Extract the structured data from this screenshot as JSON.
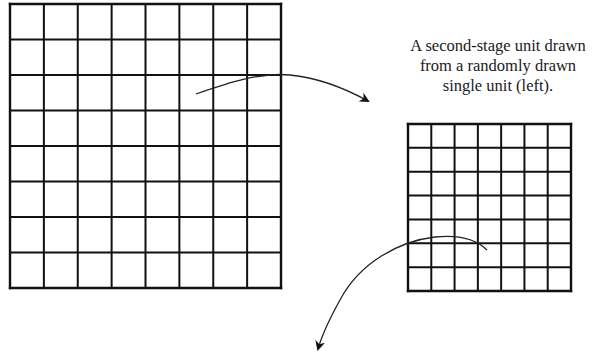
{
  "caption": {
    "lines": [
      "A second-stage unit drawn",
      "from a randomly drawn",
      "single unit (left)."
    ]
  },
  "colors": {
    "stroke": "#111111",
    "arrow": "#222222",
    "background": "#ffffff",
    "text": "#1a1a1a"
  },
  "grids": {
    "primary": {
      "label": "single-unit-grid",
      "rows": 8,
      "cols": 8,
      "x": 10,
      "y": 4,
      "width": 271,
      "height": 284
    },
    "secondary": {
      "label": "second-stage-unit-grid",
      "rows": 7,
      "cols": 7,
      "x": 408,
      "y": 124,
      "width": 163,
      "height": 167
    }
  },
  "arrows": [
    {
      "name": "arrow-to-second-stage",
      "path": "M196,94 C230,82 262,72 290,75 C320,78 348,90 368,101"
    },
    {
      "name": "arrow-to-next-stage",
      "path": "M487,250 C475,238 455,235 435,237 C400,241 360,262 340,300 C330,318 322,335 318,349"
    }
  ]
}
